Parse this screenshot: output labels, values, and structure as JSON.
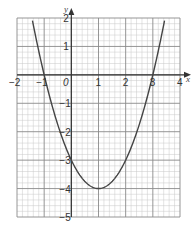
{
  "chart_data": {
    "type": "line",
    "title": "",
    "xlabel": "x",
    "ylabel": "y",
    "xlim": [
      -2,
      4
    ],
    "ylim": [
      -5,
      2
    ],
    "grid": true,
    "minor_grid_per_unit": 5,
    "legend": null,
    "x_ticks": [
      "-2",
      "-1",
      "0",
      "1",
      "2",
      "3",
      "4"
    ],
    "y_ticks": [
      "2",
      "1",
      "-1",
      "-2",
      "-3",
      "-4",
      "-5"
    ],
    "series": [
      {
        "name": "y = x^2 - 2x - 3",
        "x": [
          -1.4,
          -1,
          0,
          1,
          2,
          3,
          3.4
        ],
        "y": [
          -0.24,
          0,
          -3,
          -4,
          -3,
          0,
          1.76
        ]
      }
    ],
    "key_points": {
      "x_intercepts": [
        -1,
        3
      ],
      "y_intercept": -3,
      "vertex": [
        1,
        -4
      ]
    },
    "origin_label": "0"
  },
  "colors": {
    "curve": "#444444",
    "major_grid": "#8a8a8a",
    "minor_grid": "#c8c8c8",
    "axis": "#333333"
  }
}
